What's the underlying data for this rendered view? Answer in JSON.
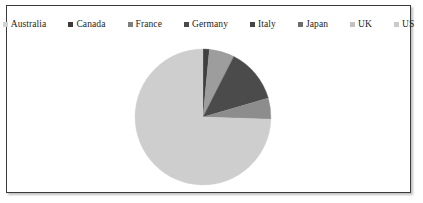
{
  "frame": {
    "border_color": "#3b3b3b",
    "background": "#ffffff"
  },
  "legend": {
    "position": "top",
    "items": [
      {
        "label": "Australia",
        "color": "#d2d2d2"
      },
      {
        "label": "Canada",
        "color": "#3a3a3a"
      },
      {
        "label": "France",
        "color": "#7e7e7e"
      },
      {
        "label": "Germany",
        "color": "#4a4a4a"
      },
      {
        "label": "Italy",
        "color": "#454545"
      },
      {
        "label": "Japan",
        "color": "#6d6d6d"
      },
      {
        "label": "UK",
        "color": "#c2c2c2"
      },
      {
        "label": "US",
        "color": "#cacaca"
      }
    ]
  },
  "chart_data": {
    "type": "pie",
    "title": "",
    "legend_position": "top",
    "start_angle": 0,
    "direction": "clockwise",
    "categories": [
      "Australia",
      "Canada",
      "France",
      "Germany",
      "Italy",
      "Japan",
      "UK",
      "US"
    ],
    "values": [
      1.5,
      6.0,
      13.0,
      5.0,
      0.0,
      0.0,
      0.0,
      74.5
    ],
    "colors": [
      "#d2d2d2",
      "#3a3a3a",
      "#7e7e7e",
      "#4a4a4a",
      "#454545",
      "#6d6d6d",
      "#c2c2c2",
      "#cacaca"
    ],
    "slices": [
      {
        "label": "Australia",
        "value": 1.5,
        "color": "#3f3f3f",
        "start_deg": 0.0,
        "end_deg": 5.4
      },
      {
        "label": "Canada",
        "value": 6.0,
        "color": "#9d9d9d",
        "start_deg": 5.4,
        "end_deg": 27.0
      },
      {
        "label": "France",
        "value": 13.0,
        "color": "#4b4b4b",
        "start_deg": 27.0,
        "end_deg": 73.8
      },
      {
        "label": "Germany",
        "value": 5.0,
        "color": "#8d8d8d",
        "start_deg": 73.8,
        "end_deg": 91.8
      },
      {
        "label": "US",
        "value": 74.5,
        "color": "#cecece",
        "start_deg": 91.8,
        "end_deg": 360.0
      }
    ],
    "center": {
      "x": 199,
      "y": 119
    },
    "radius": 67
  }
}
